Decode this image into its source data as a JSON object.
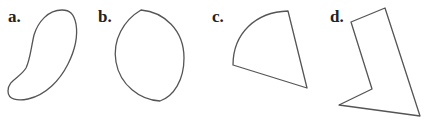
{
  "figure": {
    "stroke_color": "#555555",
    "label_color": "#222222",
    "panels": [
      {
        "label": "a.",
        "shape": "bean"
      },
      {
        "label": "b.",
        "shape": "lens"
      },
      {
        "label": "c.",
        "shape": "sector"
      },
      {
        "label": "d.",
        "shape": "irregular-polygon"
      }
    ]
  }
}
